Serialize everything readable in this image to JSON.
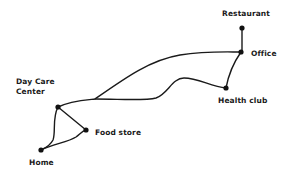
{
  "diagram": {
    "type": "network",
    "nodes": [
      {
        "id": "restaurant",
        "label": "Restaurant",
        "x": 242,
        "y": 28
      },
      {
        "id": "office",
        "label": "Office",
        "x": 241,
        "y": 52
      },
      {
        "id": "health_club",
        "label": "Health club",
        "x": 226,
        "y": 88
      },
      {
        "id": "day_care",
        "label": "Day Care\nCenter",
        "x": 58,
        "y": 107
      },
      {
        "id": "food_store",
        "label": "Food store",
        "x": 86,
        "y": 130
      },
      {
        "id": "home",
        "label": "Home",
        "x": 41,
        "y": 150
      }
    ],
    "edges": [
      {
        "from": "restaurant",
        "to": "office"
      },
      {
        "from": "office",
        "to": "health_club"
      },
      {
        "from": "day_care",
        "to": "office"
      },
      {
        "from": "day_care",
        "to": "health_club"
      },
      {
        "from": "day_care",
        "to": "food_store"
      },
      {
        "from": "day_care",
        "to": "home"
      },
      {
        "from": "food_store",
        "to": "home"
      }
    ],
    "colors": {
      "line": "#1a1a1a",
      "node": "#111111",
      "background": "#ffffff"
    }
  },
  "labels": {
    "restaurant": "Restaurant",
    "office": "Office",
    "health_club": "Health club",
    "day_care": "Day Care\nCenter",
    "food_store": "Food store",
    "home": "Home"
  }
}
